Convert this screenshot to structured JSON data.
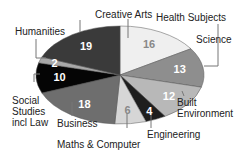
{
  "chart_data": {
    "type": "pie",
    "title": "",
    "start_angle_deg": 0,
    "direction": "clockwise",
    "slices": [
      {
        "label": "Health Subjects",
        "value": 16,
        "color": "#efefef",
        "text_color": "#888888"
      },
      {
        "label": "Science",
        "value": 13,
        "color": "#8e8e8e",
        "text_color": "#ffffff"
      },
      {
        "label": "Built Environment",
        "value": 12,
        "color": "#b8b8b8",
        "text_color": "#ffffff"
      },
      {
        "label": "Engineering",
        "value": 4,
        "color": "#1e1e1e",
        "text_color": "#ffffff"
      },
      {
        "label": "Maths & Computer",
        "value": 6,
        "color": "#d6d6d6",
        "text_color": "#888888"
      },
      {
        "label": "Business",
        "value": 18,
        "color": "#6e6e6e",
        "text_color": "#ffffff"
      },
      {
        "label": "Social Studies incl Law",
        "value": 10,
        "color": "#050505",
        "text_color": "#ffffff"
      },
      {
        "label": "Humanities",
        "value": 2,
        "color": "#a8a8a8",
        "text_color": "#ffffff"
      },
      {
        "label": "Creative Arts",
        "value": 19,
        "color": "#3a3a3a",
        "text_color": "#ffffff"
      }
    ]
  },
  "labels": {
    "health": "Health Subjects",
    "science": "Science",
    "built1": "Built",
    "built2": "Environment",
    "engineering": "Engineering",
    "maths": "Maths & Computer",
    "business": "Business",
    "social1": "Social",
    "social2": "Studies",
    "social3": "incl Law",
    "humanities": "Humanities",
    "creative": "Creative Arts"
  }
}
